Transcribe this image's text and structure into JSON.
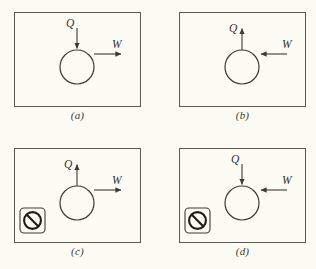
{
  "figure": {
    "background_color": "#fdfcf4",
    "line_color": "#3a3a33",
    "frame_color": "#5a5b50",
    "panel_count": 4,
    "grid": "2x2"
  },
  "symbols": {
    "heat_label": "Q",
    "work_label": "W",
    "prohibition_icon_name": "prohibition-icon"
  },
  "panels": [
    {
      "id": "a",
      "caption": "(a)",
      "heat_label": "Q",
      "heat_direction": "in",
      "heat_arrow_orientation": "down",
      "work_label": "W",
      "work_direction": "out",
      "work_arrow_orientation": "right",
      "forbidden": false,
      "description": "Heat in, work out"
    },
    {
      "id": "b",
      "caption": "(b)",
      "heat_label": "Q",
      "heat_direction": "out",
      "heat_arrow_orientation": "up",
      "work_label": "W",
      "work_direction": "in",
      "work_arrow_orientation": "left",
      "forbidden": false,
      "description": "Heat out, work in"
    },
    {
      "id": "c",
      "caption": "(c)",
      "heat_label": "Q",
      "heat_direction": "out",
      "heat_arrow_orientation": "up",
      "work_label": "W",
      "work_direction": "out",
      "work_arrow_orientation": "right",
      "forbidden": true,
      "description": "Heat out, work out - forbidden"
    },
    {
      "id": "d",
      "caption": "(d)",
      "heat_label": "Q",
      "heat_direction": "in",
      "heat_arrow_orientation": "down",
      "work_label": "W",
      "work_direction": "in",
      "work_arrow_orientation": "left",
      "forbidden": true,
      "description": "Heat in, work in - forbidden"
    }
  ]
}
